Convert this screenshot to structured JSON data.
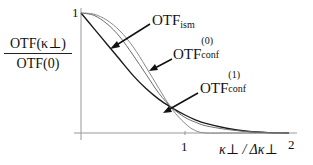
{
  "chart_data": {
    "type": "line",
    "title": "",
    "xlabel": "κ⊥ / Δκ⊥",
    "ylabel": "OTF(κ⊥) / OTF(0)",
    "xlim": [
      0,
      2.05
    ],
    "ylim": [
      0,
      1
    ],
    "grid": false,
    "legend": "inline arrows",
    "x_ticks": [
      "1",
      "2"
    ],
    "y_ticks": [
      "1"
    ],
    "x": [
      0,
      0.125,
      0.25,
      0.375,
      0.5,
      0.625,
      0.75,
      0.875,
      1.0,
      1.1,
      1.2,
      1.4,
      1.6,
      1.8,
      2.0
    ],
    "series": [
      {
        "name": "OTF_ism",
        "color": "#1a1a1a",
        "values": [
          1.0,
          0.87,
          0.74,
          0.61,
          0.48,
          0.37,
          0.28,
          0.21,
          0.15,
          0.11,
          0.08,
          0.04,
          0.015,
          0.003,
          0.0
        ]
      },
      {
        "name": "OTF_conf^(0)",
        "color": "#8a8a8a",
        "values": [
          1.0,
          0.99,
          0.94,
          0.85,
          0.72,
          0.55,
          0.37,
          0.2,
          0.08,
          0.02,
          0.0,
          0.0,
          0.0,
          0.0,
          0.0
        ]
      },
      {
        "name": "OTF_conf^(1)",
        "color": "#6e6e6e",
        "values": [
          1.0,
          0.98,
          0.91,
          0.8,
          0.65,
          0.49,
          0.33,
          0.21,
          0.13,
          0.09,
          0.06,
          0.03,
          0.012,
          0.003,
          0.0
        ]
      }
    ],
    "annotations": [
      {
        "text": "OTF_ism",
        "points_to": "OTF_ism"
      },
      {
        "text": "OTF_conf^(0)",
        "points_to": "OTF_conf^(0)"
      },
      {
        "text": "OTF_conf^(1)",
        "points_to": "OTF_conf^(1)"
      }
    ]
  },
  "labels": {
    "ylabel_num": "OTF(κ⊥)",
    "ylabel_den": "OTF(0)",
    "ytick_1": "1",
    "xtick_1": "1",
    "xtick_2": "2",
    "xlabel": "κ⊥ / Δκ⊥",
    "ism_main": "OTF",
    "ism_sub": "ism",
    "c0_main": "OTF",
    "c0_sup": "(0)",
    "c0_sub": "conf",
    "c1_main": "OTF",
    "c1_sup": "(1)",
    "c1_sub": "conf"
  }
}
